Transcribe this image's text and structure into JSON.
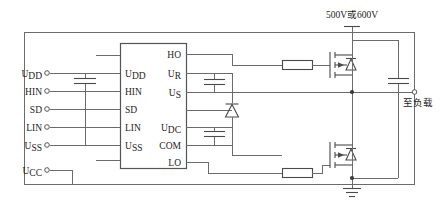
{
  "diagram": {
    "bus_voltage_label": "500V或600V",
    "load_label": "至负载",
    "ic": {
      "name": "driver-ic",
      "left_pins": [
        {
          "base": "U",
          "sub": "DD",
          "full": "UDD"
        },
        {
          "base": "HIN",
          "sub": "",
          "full": "HIN"
        },
        {
          "base": "SD",
          "sub": "",
          "full": "SD"
        },
        {
          "base": "LIN",
          "sub": "",
          "full": "LIN"
        },
        {
          "base": "U",
          "sub": "SS",
          "full": "USS"
        }
      ],
      "right_pins": [
        {
          "base": "HO",
          "sub": "",
          "full": "HO"
        },
        {
          "base": "U",
          "sub": "R",
          "full": "UR"
        },
        {
          "base": "U",
          "sub": "S",
          "full": "US"
        },
        {
          "base": "U",
          "sub": "DC",
          "full": "UDC"
        },
        {
          "base": "COM",
          "sub": "",
          "full": "COM"
        },
        {
          "base": "LO",
          "sub": "",
          "full": "LO"
        }
      ]
    },
    "input_terminals": [
      {
        "base": "U",
        "sub": "DD",
        "full": "UDD"
      },
      {
        "base": "HIN",
        "sub": "",
        "full": "HIN"
      },
      {
        "base": "SD",
        "sub": "",
        "full": "SD"
      },
      {
        "base": "LIN",
        "sub": "",
        "full": "LIN"
      },
      {
        "base": "U",
        "sub": "SS",
        "full": "USS"
      },
      {
        "base": "U",
        "sub": "CC",
        "full": "UCC"
      }
    ],
    "components": {
      "input_capacitor": "input-decoupling-capacitor",
      "bootstrap_capacitor": "bootstrap-capacitor",
      "bootstrap_diode": "bootstrap-diode",
      "vcc_capacitor": "vcc-bypass-capacitor",
      "dc_link_capacitor": "dc-link-capacitor",
      "high_side_gate_resistor": "high-side-gate-resistor",
      "low_side_gate_resistor": "low-side-gate-resistor",
      "high_side_mosfet": "high-side-mosfet",
      "low_side_mosfet": "low-side-mosfet",
      "ground": "ground-symbol"
    },
    "colors": {
      "wire": "#6b6b6b",
      "component": "#4a4a4a",
      "text": "#1c1c1c",
      "background": "#ffffff"
    }
  }
}
